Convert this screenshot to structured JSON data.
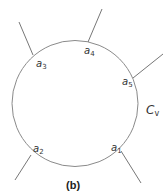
{
  "diagram": {
    "caption": "(b)",
    "cycle_label": {
      "main": "C",
      "sub": "v"
    },
    "circle": {
      "cx": 75,
      "cy": 103.5,
      "r": 63,
      "stroke": "#8a8a8a"
    },
    "nodes": [
      {
        "id": "a1",
        "main": "a",
        "sub": "1",
        "x1": 121,
        "y1": 151,
        "x2": 141,
        "y2": 183,
        "lx": 111,
        "ly": 143
      },
      {
        "id": "a2",
        "main": "a",
        "sub": "2",
        "x1": 31,
        "y1": 155,
        "x2": 15,
        "y2": 180,
        "lx": 33,
        "ly": 144
      },
      {
        "id": "a3",
        "main": "a",
        "sub": "3",
        "x1": 33,
        "y1": 55,
        "x2": 19,
        "y2": 22,
        "lx": 36,
        "ly": 59
      },
      {
        "id": "a4",
        "main": "a",
        "sub": "4",
        "x1": 88,
        "y1": 42,
        "x2": 102,
        "y2": 9,
        "lx": 84,
        "ly": 46
      },
      {
        "id": "a5",
        "main": "a",
        "sub": "5",
        "x1": 133,
        "y1": 78,
        "x2": 163,
        "y2": 54,
        "lx": 122,
        "ly": 77
      }
    ]
  }
}
